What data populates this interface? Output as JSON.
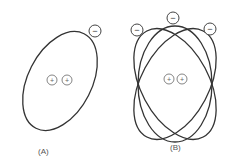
{
  "panels": [
    {
      "label": "(A)",
      "orbits": 1,
      "electrons": [
        {
          "sign": "−"
        }
      ],
      "nuclei": [
        {
          "sign": "+"
        },
        {
          "sign": "+"
        }
      ]
    },
    {
      "label": "(B)",
      "orbits": 3,
      "electrons": [
        {
          "sign": "−"
        },
        {
          "sign": "−"
        },
        {
          "sign": "−"
        }
      ],
      "nuclei": [
        {
          "sign": "+"
        },
        {
          "sign": "+"
        }
      ]
    }
  ],
  "colors": {
    "orbit": "#333333",
    "particle_stroke": "#555555",
    "particle_fill": "#ffffff",
    "label": "#555555"
  }
}
